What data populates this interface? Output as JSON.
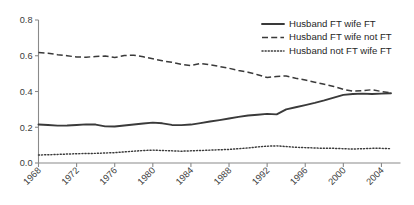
{
  "chart_data": {
    "type": "line",
    "title": "",
    "subtitle": "",
    "xlabel": "",
    "ylabel": "",
    "xlim": [
      1968,
      2006
    ],
    "ylim": [
      0.0,
      0.8
    ],
    "grid": false,
    "legend_position": "top-right",
    "x_ticks": [
      "1968",
      "1972",
      "1976",
      "1980",
      "1984",
      "1988",
      "1992",
      "1996",
      "2000",
      "2004"
    ],
    "x_tick_values": [
      1968,
      1972,
      1976,
      1980,
      1984,
      1988,
      1992,
      1996,
      2000,
      2004
    ],
    "y_ticks": [
      "0.0",
      "0.2",
      "0.4",
      "0.6",
      "0.8"
    ],
    "y_tick_values": [
      0.0,
      0.2,
      0.4,
      0.6,
      0.8
    ],
    "x": [
      1968,
      1969,
      1970,
      1971,
      1972,
      1973,
      1974,
      1975,
      1976,
      1977,
      1978,
      1979,
      1980,
      1981,
      1982,
      1983,
      1984,
      1985,
      1986,
      1987,
      1988,
      1989,
      1990,
      1991,
      1992,
      1993,
      1994,
      1995,
      1996,
      1997,
      1998,
      1999,
      2000,
      2001,
      2002,
      2003,
      2004,
      2005
    ],
    "series": [
      {
        "name": "Husband FT wife FT",
        "style": "solid",
        "color": "#3a3a3a",
        "values": [
          0.215,
          0.213,
          0.209,
          0.21,
          0.213,
          0.216,
          0.215,
          0.205,
          0.204,
          0.21,
          0.215,
          0.221,
          0.226,
          0.222,
          0.213,
          0.212,
          0.215,
          0.223,
          0.232,
          0.24,
          0.249,
          0.258,
          0.266,
          0.27,
          0.275,
          0.272,
          0.3,
          0.312,
          0.324,
          0.336,
          0.35,
          0.366,
          0.381,
          0.386,
          0.388,
          0.386,
          0.388,
          0.39
        ]
      },
      {
        "name": "Husband FT wife not FT",
        "style": "dashed",
        "color": "#3a3a3a",
        "values": [
          0.618,
          0.614,
          0.606,
          0.6,
          0.593,
          0.592,
          0.596,
          0.598,
          0.59,
          0.601,
          0.603,
          0.594,
          0.583,
          0.572,
          0.563,
          0.552,
          0.545,
          0.557,
          0.549,
          0.54,
          0.53,
          0.518,
          0.508,
          0.494,
          0.478,
          0.484,
          0.487,
          0.474,
          0.464,
          0.452,
          0.44,
          0.428,
          0.412,
          0.402,
          0.404,
          0.41,
          0.4,
          0.392
        ]
      },
      {
        "name": "Husband not FT wife FT",
        "style": "dotted",
        "color": "#6f6f6f",
        "values": [
          0.045,
          0.046,
          0.048,
          0.05,
          0.052,
          0.053,
          0.054,
          0.056,
          0.058,
          0.062,
          0.066,
          0.07,
          0.072,
          0.07,
          0.068,
          0.066,
          0.068,
          0.07,
          0.072,
          0.074,
          0.076,
          0.08,
          0.084,
          0.09,
          0.094,
          0.096,
          0.092,
          0.088,
          0.086,
          0.084,
          0.082,
          0.082,
          0.08,
          0.078,
          0.08,
          0.082,
          0.082,
          0.08
        ]
      }
    ],
    "legend": [
      "Husband FT wife FT",
      "Husband FT wife not FT",
      "Husband not FT wife FT"
    ]
  }
}
